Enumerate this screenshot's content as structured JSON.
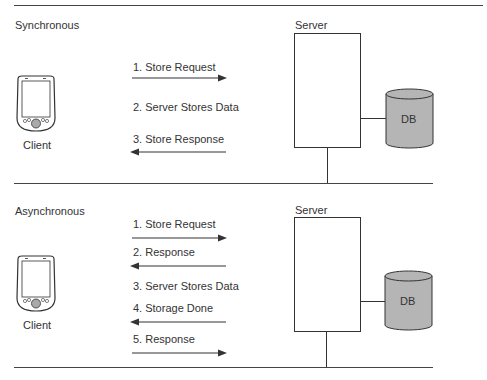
{
  "sync": {
    "title": "Synchronous",
    "server_label": "Server",
    "db_label": "DB",
    "client_label": "Client",
    "steps": [
      {
        "label": "1. Store Request",
        "arrow": "right"
      },
      {
        "label": "2. Server Stores Data",
        "arrow": "none"
      },
      {
        "label": "3. Store Response",
        "arrow": "left"
      }
    ]
  },
  "async": {
    "title": "Asynchronous",
    "server_label": "Server",
    "db_label": "DB",
    "client_label": "Client",
    "steps": [
      {
        "label": "1. Store Request",
        "arrow": "right"
      },
      {
        "label": "2. Response",
        "arrow": "left"
      },
      {
        "label": "3. Server Stores Data",
        "arrow": "none"
      },
      {
        "label": "4. Storage Done",
        "arrow": "left"
      },
      {
        "label": "5. Response",
        "arrow": "right"
      }
    ]
  },
  "colors": {
    "db_fill": "#b5b5b5",
    "line": "#333333"
  }
}
